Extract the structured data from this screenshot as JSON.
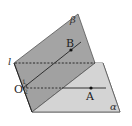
{
  "figure": {
    "type": "geometry-dihedral-angle",
    "colors": {
      "plane_alpha": "#d2d2d2",
      "plane_beta": "#9a9a9a",
      "line": "#1a1a1a",
      "background": "#ffffff"
    },
    "labels": {
      "plane_beta": "β",
      "plane_alpha": "α",
      "edge_line": "l",
      "point_O": "O",
      "point_A": "A",
      "point_B": "B",
      "angle_mark_1": "1",
      "angle_mark_2": "2"
    }
  }
}
